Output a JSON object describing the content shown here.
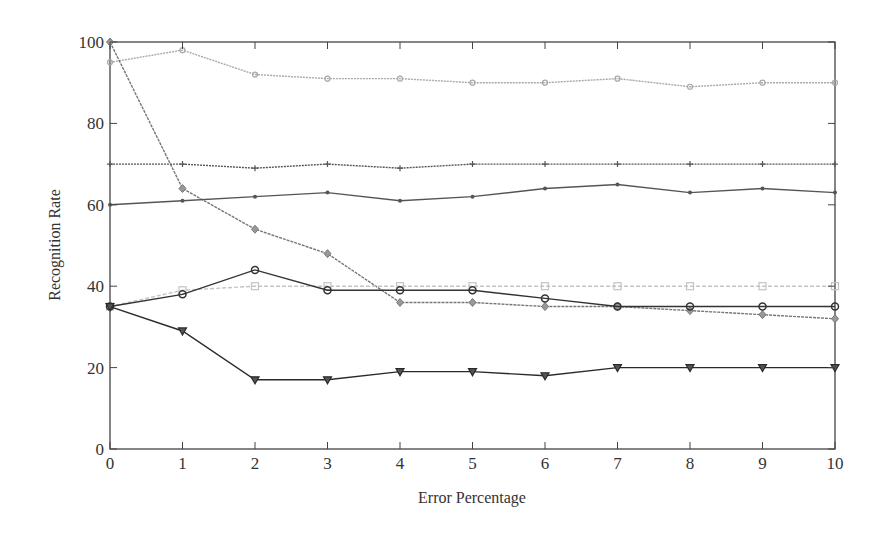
{
  "chart_data": {
    "type": "line",
    "title": "",
    "xlabel": "Error Percentage",
    "ylabel": "Recognition Rate",
    "x": [
      0,
      1,
      2,
      3,
      4,
      5,
      6,
      7,
      8,
      9,
      10
    ],
    "xlim": [
      0,
      10
    ],
    "ylim": [
      0,
      100
    ],
    "xticks": [
      "0",
      "1",
      "2",
      "3",
      "4",
      "5",
      "6",
      "7",
      "8",
      "9",
      "10"
    ],
    "yticks": [
      "0",
      "20",
      "40",
      "60",
      "80",
      "100"
    ],
    "grid": false,
    "legend": null,
    "series": [
      {
        "name": "series-light-circle-top",
        "color": "#a8a8a8",
        "marker": "circle",
        "dash": "2,1",
        "values": [
          95,
          98,
          92,
          91,
          91,
          90,
          90,
          91,
          89,
          90,
          90
        ]
      },
      {
        "name": "series-diamond-drop",
        "color": "#777777",
        "marker": "diamond",
        "dash": "3,1",
        "values": [
          100,
          64,
          54,
          48,
          36,
          36,
          35,
          35,
          34,
          33,
          32
        ]
      },
      {
        "name": "series-plus-70",
        "color": "#555555",
        "marker": "plus",
        "dash": "2,1",
        "values": [
          70,
          70,
          69,
          70,
          69,
          70,
          70,
          70,
          70,
          70,
          70
        ]
      },
      {
        "name": "series-dot-60",
        "color": "#555555",
        "marker": "dot",
        "dash": "",
        "values": [
          60,
          61,
          62,
          63,
          61,
          62,
          64,
          65,
          63,
          64,
          63
        ]
      },
      {
        "name": "series-light-square",
        "color": "#c4c4c4",
        "marker": "square",
        "dash": "4,2",
        "values": [
          35,
          39,
          40,
          40,
          40,
          40,
          40,
          40,
          40,
          40,
          40
        ]
      },
      {
        "name": "series-dark-circle",
        "color": "#333333",
        "marker": "circle-open",
        "dash": "",
        "values": [
          35,
          38,
          44,
          39,
          39,
          39,
          37,
          35,
          35,
          35,
          35
        ]
      },
      {
        "name": "series-triangle-down",
        "color": "#2a2a2a",
        "marker": "triangle-down",
        "dash": "",
        "values": [
          35,
          29,
          17,
          17,
          19,
          19,
          18,
          20,
          20,
          20,
          20
        ]
      }
    ]
  }
}
